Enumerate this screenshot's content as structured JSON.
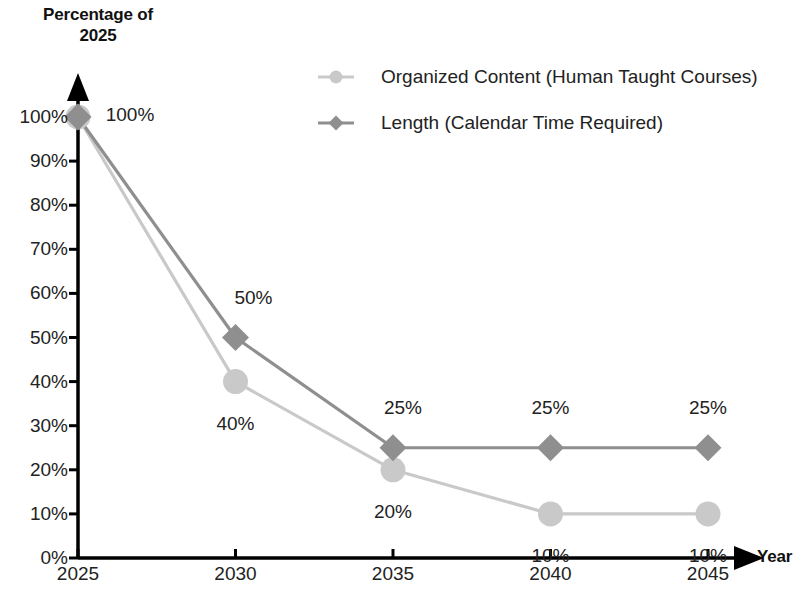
{
  "chart_data": {
    "type": "line",
    "title": "",
    "xlabel": "Year",
    "ylabel": "Percentage of\n2025",
    "x": [
      2025,
      2030,
      2035,
      2040,
      2045
    ],
    "categories": [
      "2025",
      "2030",
      "2035",
      "2040",
      "2045"
    ],
    "xtick_labels": [
      "2025",
      "2030",
      "2035",
      "2040",
      "2045"
    ],
    "ytick_labels": [
      "0%",
      "10%",
      "20%",
      "30%",
      "40%",
      "50%",
      "60%",
      "70%",
      "80%",
      "90%",
      "100%"
    ],
    "ytick_values": [
      0,
      10,
      20,
      30,
      40,
      50,
      60,
      70,
      80,
      90,
      100
    ],
    "ylim": [
      0,
      100
    ],
    "grid": false,
    "legend_position": "top-right",
    "series": [
      {
        "name": "Organized Content (Human Taught Courses)",
        "marker": "circle",
        "color": "#c9c9c9",
        "values": [
          100,
          40,
          20,
          10,
          10
        ],
        "data_labels": [
          "100%",
          "40%",
          "20%",
          "10%",
          "10%"
        ]
      },
      {
        "name": "Length (Calendar Time Required)",
        "marker": "diamond",
        "color": "#8f8f8f",
        "values": [
          100,
          50,
          25,
          25,
          25
        ],
        "data_labels": [
          "100%",
          "50%",
          "25%",
          "25%",
          "25%"
        ]
      }
    ]
  },
  "legend": {
    "entries": [
      {
        "label": "Organized Content (Human Taught Courses)",
        "marker": "circle-marker-icon"
      },
      {
        "label": "Length (Calendar Time Required)",
        "marker": "diamond-marker-icon"
      }
    ]
  },
  "axes": {
    "y_title": "Percentage of\n2025",
    "x_title": "Year",
    "axis_color": "#000000"
  }
}
